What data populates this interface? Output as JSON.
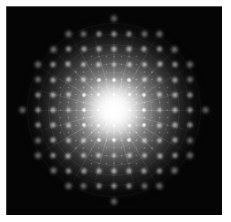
{
  "figure": {
    "name": "diffraction-pattern",
    "caption": "",
    "pattern_type": "square-lattice-diffraction",
    "background_color": "#050505",
    "page_color": "#ffffff",
    "spot_color": "#ffffff",
    "halo_color": "#c8c8c8"
  },
  "plate": {
    "x": 6,
    "y": 6,
    "width": 216,
    "height": 209
  },
  "chart_data": {
    "type": "scatter",
    "subtitle": "",
    "xlabel": "",
    "ylabel": "",
    "xlim": [
      -108,
      108
    ],
    "ylim": [
      -104,
      104
    ],
    "grid": false,
    "legend": null,
    "annotations": [],
    "tick_labels": {
      "x": [],
      "y": []
    },
    "geometry": {
      "center_x": 108,
      "center_y": 104,
      "lattice_spacing": 15.2,
      "lattice_orders": 6,
      "halo_radius": 95,
      "core_radius": 34,
      "spoke_count": 24,
      "ring_radii": [
        14,
        22,
        30,
        38,
        47,
        56,
        66,
        76,
        87
      ],
      "spot_size_inner": 3.6,
      "spot_size_outer": 9.5
    },
    "intensity_profile": {
      "description": "Intensity falls off radially from a saturated central maximum to the dark background at the halo edge.",
      "radii": [
        0,
        12,
        24,
        36,
        48,
        60,
        72,
        84,
        95
      ],
      "values": [
        1.0,
        0.94,
        0.85,
        0.74,
        0.62,
        0.48,
        0.33,
        0.17,
        0.0
      ]
    },
    "series": [
      {
        "name": "diffraction maxima",
        "description": "Bright spots on a square lattice; spot brightness decreases and spot size increases with distance from the centre.",
        "lattice": "square",
        "spacing": 15.2,
        "max_order": 6
      }
    ]
  }
}
